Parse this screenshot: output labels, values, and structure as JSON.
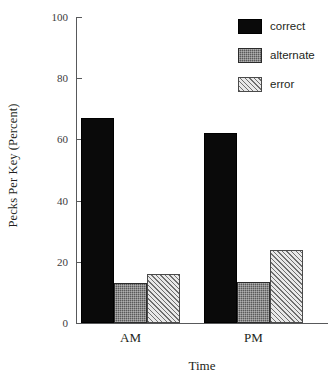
{
  "chart_data": {
    "type": "bar",
    "title": "",
    "xlabel": "Time",
    "ylabel": "Pecks Per Key (Percent)",
    "categories": [
      "AM",
      "PM"
    ],
    "series": [
      {
        "name": "correct",
        "values": [
          67,
          62
        ],
        "color": "#0a0a0a",
        "pattern": "solid-black"
      },
      {
        "name": "alternate",
        "values": [
          13,
          13.5
        ],
        "color": "#5a5a5a",
        "pattern": "dotted-gray"
      },
      {
        "name": "error",
        "values": [
          16,
          24
        ],
        "color": "#e9e9e9",
        "pattern": "diagonal-hatch"
      }
    ],
    "ylim": [
      0,
      100
    ],
    "yticks": [
      0,
      20,
      40,
      60,
      80,
      100
    ],
    "yticklabels": [
      "0",
      "20",
      "40",
      "60",
      "80",
      "100"
    ],
    "grid": false,
    "legend_position": "top-right",
    "legend_entries": [
      "correct",
      "alternate",
      "error"
    ]
  },
  "axes": {
    "y_label": "Pecks Per Key (Percent)",
    "x_label": "Time"
  }
}
